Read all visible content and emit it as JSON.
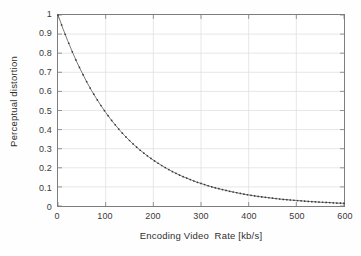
{
  "chart_data": {
    "type": "line",
    "title": "",
    "subtitle": "",
    "xlabel": "Encoding Video  Rate [kb/s]",
    "ylabel": "Perceptual distortion",
    "xlim": [
      0,
      600
    ],
    "ylim": [
      0,
      1
    ],
    "grid": true,
    "legend": null,
    "legend_position": "none",
    "marker": "dot",
    "line_color": "#555555",
    "grid_color": "#dcdcdc",
    "axis_color": "#7d7d7d",
    "xticks": [
      0,
      100,
      200,
      300,
      400,
      500,
      600
    ],
    "xtick_labels": [
      "0",
      "100",
      "200",
      "300",
      "400",
      "500",
      "600"
    ],
    "yticks": [
      0,
      0.1,
      0.2,
      0.3,
      0.4,
      0.5,
      0.6,
      0.7,
      0.8,
      0.9,
      1
    ],
    "ytick_labels": [
      "0",
      "0.1",
      "0.2",
      "0.3",
      "0.4",
      "0.5",
      "0.6",
      "0.7",
      "0.8",
      "0.9",
      "1"
    ],
    "series": [
      {
        "name": "perceptual distortion",
        "x": [
          0,
          10,
          20,
          30,
          40,
          50,
          60,
          70,
          80,
          90,
          100,
          110,
          120,
          130,
          140,
          150,
          160,
          170,
          180,
          190,
          200,
          210,
          220,
          230,
          240,
          250,
          260,
          270,
          280,
          290,
          300,
          310,
          320,
          330,
          340,
          350,
          360,
          370,
          380,
          390,
          400,
          410,
          420,
          430,
          440,
          450,
          460,
          470,
          480,
          490,
          500,
          510,
          520,
          530,
          540,
          550,
          560,
          570,
          580,
          590,
          600
        ],
        "values": [
          1.0,
          0.931,
          0.867,
          0.807,
          0.751,
          0.7,
          0.651,
          0.606,
          0.565,
          0.526,
          0.49,
          0.456,
          0.425,
          0.395,
          0.368,
          0.343,
          0.319,
          0.297,
          0.277,
          0.258,
          0.24,
          0.224,
          0.208,
          0.194,
          0.18,
          0.168,
          0.156,
          0.146,
          0.136,
          0.126,
          0.118,
          0.11,
          0.102,
          0.095,
          0.089,
          0.083,
          0.077,
          0.072,
          0.067,
          0.062,
          0.058,
          0.054,
          0.05,
          0.047,
          0.044,
          0.041,
          0.038,
          0.035,
          0.033,
          0.031,
          0.029,
          0.027,
          0.025,
          0.023,
          0.022,
          0.02,
          0.019,
          0.018,
          0.016,
          0.015,
          0.014
        ]
      }
    ]
  }
}
